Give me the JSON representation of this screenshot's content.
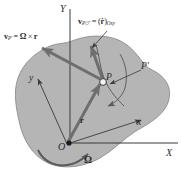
{
  "figure": {
    "name": "rigid-body-rotating-frame-velocity-diagram",
    "type": "mechanics-vector-diagram",
    "background_color": "#ffffff",
    "body_fill_color": "#b5b5b5",
    "body_stroke_color": "#8c8c8c",
    "vector_color": "#6e6e6e",
    "line_color": "#3a3a3a",
    "text_color": "#2b2b2b"
  },
  "axes": {
    "global_vertical_label": "Y",
    "global_horizontal_label": "X",
    "body_vertical_label": "y",
    "body_horizontal_label": "x"
  },
  "points": {
    "origin_label": "O",
    "point_label": "P",
    "point_prime_label": "P'"
  },
  "vectors": {
    "position_label": "r",
    "omega_label": "Ω",
    "velocity_transport": {
      "v": "v",
      "sub": "P'",
      "equals": "=",
      "omega": "Ω",
      "cross": "×",
      "r": "r",
      "full_text": "v_P' = Ω × r"
    },
    "velocity_relative": {
      "v": "v",
      "sub": "P/ℱ",
      "equals": "=",
      "open": "(",
      "rdot": "ṙ",
      "close": ")",
      "frame_sub": "Oxy",
      "full_text": "v_P/ℱ = (ṙ)_Oxy"
    }
  }
}
